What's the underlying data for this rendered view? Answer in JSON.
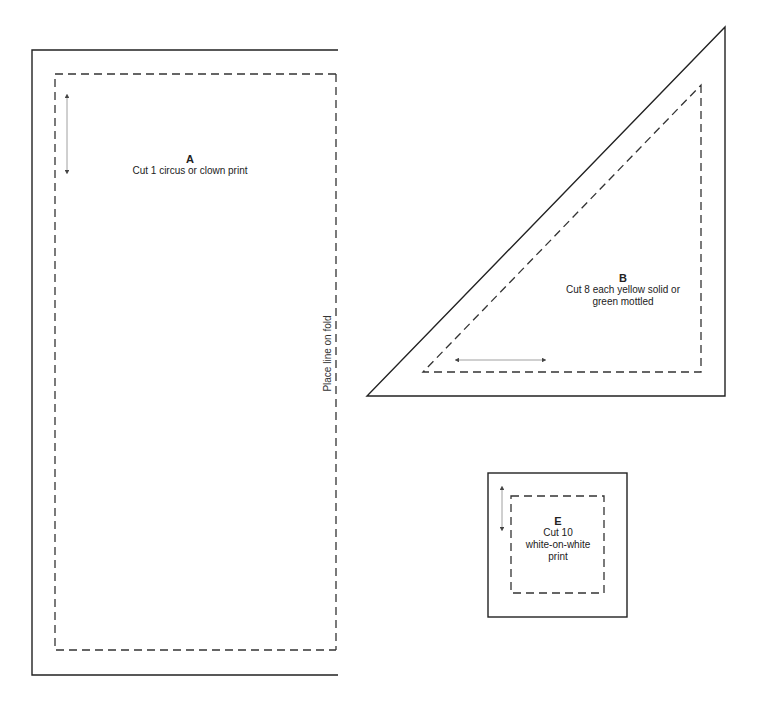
{
  "pieces": {
    "a": {
      "letter": "A",
      "instruction": "Cut 1 circus or clown print",
      "fold_label": "Place line on fold"
    },
    "b": {
      "letter": "B",
      "instruction_line1": "Cut 8 each yellow solid or",
      "instruction_line2": "green mottled"
    },
    "e": {
      "letter": "E",
      "instruction_line1": "Cut 10",
      "instruction_line2": "white-on-white",
      "instruction_line3": "print"
    }
  },
  "colors": {
    "cut_line": "#222222",
    "seam_line": "#333333",
    "grain_arrow": "#888888"
  }
}
